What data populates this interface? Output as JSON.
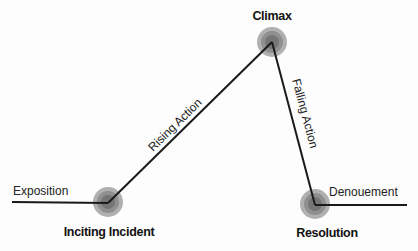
{
  "diagram": {
    "colors": {
      "line": "#1a1a1a",
      "node_outer": "#a8a8a8",
      "node_mid": "#8c8c8c",
      "node_inner": "#6e6e6e",
      "text": "#222222"
    },
    "nodes": [
      {
        "id": "inciting",
        "label": "Inciting Incident",
        "x": 108,
        "y": 202
      },
      {
        "id": "climax",
        "label": "Climax",
        "x": 272,
        "y": 42
      },
      {
        "id": "resolution",
        "label": "Resolution",
        "x": 315,
        "y": 204
      }
    ],
    "segments": [
      {
        "id": "exposition",
        "label": "Exposition"
      },
      {
        "id": "rising",
        "label": "Rising Action"
      },
      {
        "id": "falling",
        "label": "Falling Action"
      },
      {
        "id": "denouement",
        "label": "Denouement"
      }
    ]
  }
}
